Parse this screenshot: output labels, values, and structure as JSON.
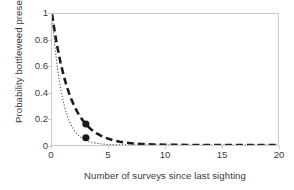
{
  "chart_data": {
    "type": "line",
    "title": "",
    "xlabel": "Number of surveys since last sighting",
    "ylabel": "Probability bottleweed present",
    "xlim": [
      0,
      20
    ],
    "ylim": [
      0,
      1
    ],
    "xticks": [
      "0",
      "5",
      "10",
      "15",
      "20"
    ],
    "xtick_values": [
      0,
      5,
      10,
      15,
      20
    ],
    "yticks": [
      "0",
      "0.2",
      "0.4",
      "0.6",
      "0.8",
      "1"
    ],
    "ytick_values": [
      0,
      0.2,
      0.4,
      0.6,
      0.8,
      1
    ],
    "grid": false,
    "legend": "none",
    "series": [
      {
        "name": "thick-dashed-curve",
        "style": "dashed",
        "color": "#1a1a1a",
        "x": [
          0,
          0.25,
          0.5,
          0.75,
          1,
          1.25,
          1.5,
          1.75,
          2,
          2.25,
          2.5,
          2.75,
          3,
          3.25,
          3.5,
          3.75,
          4,
          4.5,
          5,
          5.5,
          6,
          6.5,
          7,
          7.5,
          8,
          9,
          10,
          11,
          12,
          13,
          14,
          15,
          16,
          17,
          18,
          19,
          20
        ],
        "values": [
          1.0,
          0.858,
          0.736,
          0.631,
          0.541,
          0.464,
          0.398,
          0.342,
          0.293,
          0.251,
          0.216,
          0.185,
          0.159,
          0.136,
          0.117,
          0.1,
          0.086,
          0.063,
          0.047,
          0.034,
          0.025,
          0.018,
          0.014,
          0.01,
          0.0073,
          0.0039,
          0.0021,
          0.0011,
          0.0006,
          0.0003,
          0.0002,
          0.0001,
          0.0001,
          0.0,
          0.0,
          0.0,
          0.0
        ]
      },
      {
        "name": "thin-dotted-curve",
        "style": "dotted",
        "color": "#4a4a4a",
        "x": [
          0,
          0.25,
          0.5,
          0.75,
          1,
          1.25,
          1.5,
          1.75,
          2,
          2.25,
          2.5,
          2.75,
          3,
          3.25,
          3.5,
          3.75,
          4,
          4.5,
          5,
          5.5,
          6,
          6.5,
          7,
          7.5,
          8,
          9,
          10,
          11,
          12,
          13,
          14,
          15,
          16,
          17,
          18,
          19,
          20
        ],
        "values": [
          1.0,
          0.757,
          0.574,
          0.435,
          0.329,
          0.249,
          0.189,
          0.143,
          0.108,
          0.082,
          0.062,
          0.047,
          0.036,
          0.027,
          0.02,
          0.016,
          0.012,
          0.0068,
          0.0039,
          0.0023,
          0.0013,
          0.0007,
          0.0004,
          0.0002,
          0.0001,
          0.0,
          0.0,
          0.0,
          0.0,
          0.0,
          0.0,
          0.0,
          0.0,
          0.0,
          0.0,
          0.0,
          0.0
        ]
      }
    ],
    "markers": [
      {
        "name": "upper-data-point",
        "x": 3,
        "y": 0.16,
        "shape": "circle",
        "color": "#1a1a1a"
      },
      {
        "name": "lower-data-point",
        "x": 3,
        "y": 0.055,
        "shape": "circle",
        "color": "#1a1a1a"
      }
    ]
  }
}
